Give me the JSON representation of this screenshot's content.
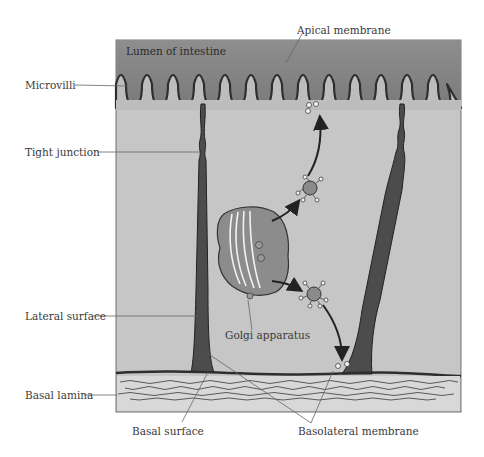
{
  "diagram": {
    "panel_label": "Lumen of intestine",
    "labels": {
      "apical_membrane": "Apical membrane",
      "microvilli": "Microvilli",
      "tight_junction": "Tight junction",
      "lateral_surface": "Lateral surface",
      "golgi_apparatus": "Golgi apparatus",
      "basal_lamina": "Basal lamina",
      "basal_surface": "Basal surface",
      "basolateral_membrane": "Basolateral membrane"
    },
    "colors": {
      "lumen": "#8a8a8a",
      "cytoplasm": "#c4c4c4",
      "membrane": "#333333",
      "basal_lamina_bg": "#dcdcdc",
      "label_text": "#3a3a3a",
      "leader_line": "#555555"
    }
  }
}
